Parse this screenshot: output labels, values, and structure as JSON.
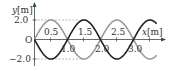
{
  "diagram": {
    "type": "wave-plot",
    "y_axis_label": "y",
    "y_axis_unit": "[m]",
    "x_axis_label": "x",
    "x_axis_unit": "[m]",
    "origin_label": "O",
    "y_ticks": [
      {
        "value": 2.0,
        "label": "2.0"
      },
      {
        "value": -2.0,
        "label": "−2.0"
      }
    ],
    "x_ticks_above": [
      {
        "value": 0.5,
        "label": "0.5"
      },
      {
        "value": 1.5,
        "label": "1.5"
      },
      {
        "value": 2.5,
        "label": "2.5"
      }
    ],
    "x_ticks_below": [
      {
        "value": 1.0,
        "label": "1.0"
      },
      {
        "value": 2.0,
        "label": "2.0"
      },
      {
        "value": 3.0,
        "label": "3.0"
      }
    ],
    "waves": [
      {
        "name": "wave-gray",
        "amplitude": 2.0,
        "wavelength": 2.0,
        "phase": "+sin",
        "color": "#9a9a9a"
      },
      {
        "name": "wave-black",
        "amplitude": 2.0,
        "wavelength": 2.0,
        "phase": "-sin",
        "color": "#222222"
      }
    ],
    "x_range": [
      0,
      3.7
    ],
    "y_range": [
      -2.0,
      2.0
    ]
  }
}
